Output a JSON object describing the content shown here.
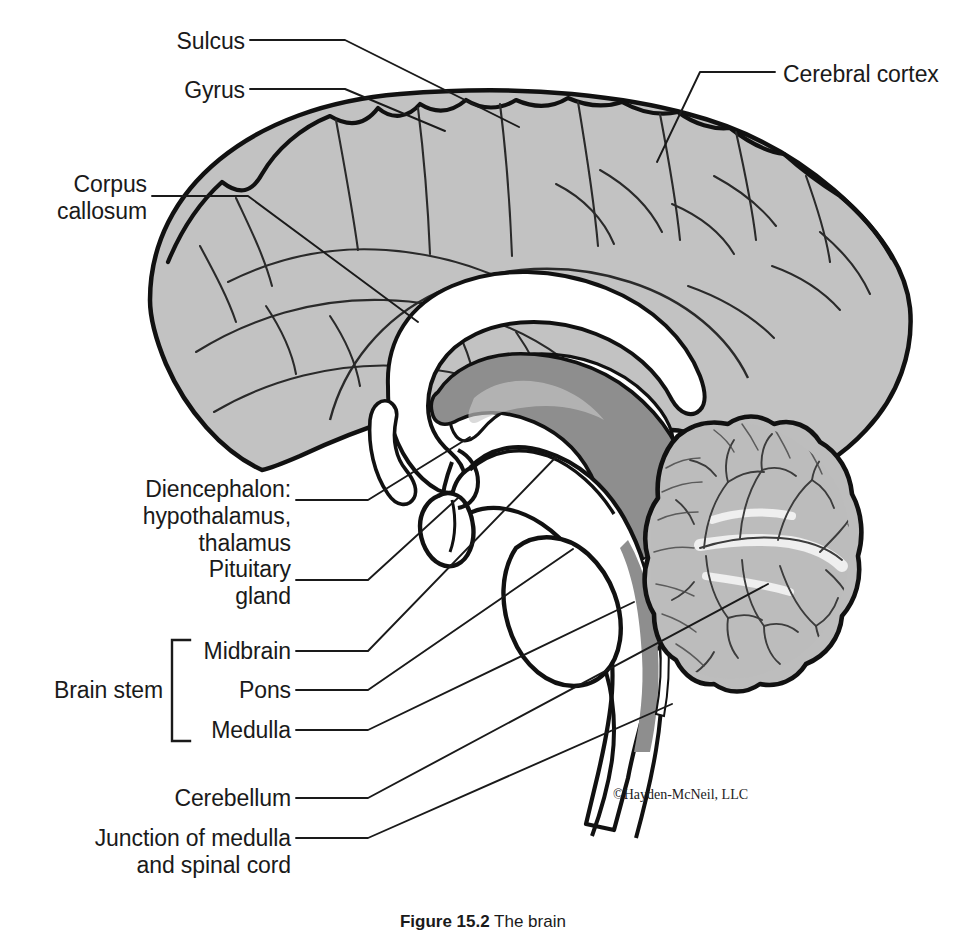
{
  "figure": {
    "copyright": "©Hayden-McNeil, LLC",
    "caption_number": "Figure 15.2",
    "caption_text": "The brain"
  },
  "colors": {
    "background": "#ffffff",
    "outline": "#111111",
    "cortex_fill": "#c2c2c2",
    "white_matter_fill": "#ffffff",
    "diencephalon_fill": "#8e8e8e",
    "brainstem_fill": "#8e8e8e",
    "cerebellum_fill": "#bdbdbd",
    "cerebellum_core": "#e8e8e8",
    "text": "#1a1a1a",
    "leader_line": "#1a1a1a"
  },
  "labels": [
    {
      "id": "sulcus",
      "text": "Sulcus",
      "align": "right",
      "x": 20,
      "y": 28,
      "width": 245
    },
    {
      "id": "gyrus",
      "text": "Gyrus",
      "align": "right",
      "x": 20,
      "y": 77,
      "width": 245
    },
    {
      "id": "corpus-callosum",
      "text": "Corpus\ncallosum",
      "align": "right",
      "x": 20,
      "y": 170,
      "width": 130
    },
    {
      "id": "cerebral-cortex",
      "text": "Cerebral cortex",
      "align": "left",
      "x": 783,
      "y": 62,
      "width": 190
    },
    {
      "id": "diencephalon",
      "text": "Diencephalon:\nhypothalamus,\nthalamus",
      "align": "right",
      "x": 40,
      "y": 475,
      "width": 250
    },
    {
      "id": "pituitary-gland",
      "text": "Pituitary\ngland",
      "align": "right",
      "x": 40,
      "y": 556,
      "width": 250
    },
    {
      "id": "midbrain",
      "text": "Midbrain",
      "align": "right",
      "x": 40,
      "y": 637,
      "width": 250
    },
    {
      "id": "pons",
      "text": "Pons",
      "align": "right",
      "x": 40,
      "y": 676,
      "width": 250
    },
    {
      "id": "medulla",
      "text": "Medulla",
      "align": "right",
      "x": 40,
      "y": 716,
      "width": 250
    },
    {
      "id": "brain-stem",
      "text": "Brain stem",
      "align": "right",
      "x": 0,
      "y": 676,
      "width": 155
    },
    {
      "id": "cerebellum",
      "text": "Cerebellum",
      "align": "right",
      "x": 40,
      "y": 784,
      "width": 250
    },
    {
      "id": "junction",
      "text": "Junction of medulla\nand spinal cord",
      "align": "right",
      "x": 20,
      "y": 824,
      "width": 270
    }
  ],
  "structures": [
    {
      "id": "cerebral-cortex",
      "name": "Cerebral cortex",
      "fill": "#c2c2c2"
    },
    {
      "id": "corpus-callosum",
      "name": "Corpus callosum",
      "fill": "#ffffff"
    },
    {
      "id": "diencephalon",
      "name": "Diencephalon",
      "fill": "#8e8e8e"
    },
    {
      "id": "midbrain",
      "name": "Midbrain",
      "fill": "#ffffff"
    },
    {
      "id": "pons",
      "name": "Pons",
      "fill": "#ffffff"
    },
    {
      "id": "medulla",
      "name": "Medulla",
      "fill": "#ffffff"
    },
    {
      "id": "pituitary-gland",
      "name": "Pituitary gland",
      "fill": "#ffffff"
    },
    {
      "id": "cerebellum",
      "name": "Cerebellum",
      "fill": "#bdbdbd"
    },
    {
      "id": "spinal-cord",
      "name": "Spinal cord",
      "fill": "#ffffff"
    }
  ],
  "bracket": {
    "label": "Brain stem",
    "members": [
      "Midbrain",
      "Pons",
      "Medulla"
    ]
  }
}
